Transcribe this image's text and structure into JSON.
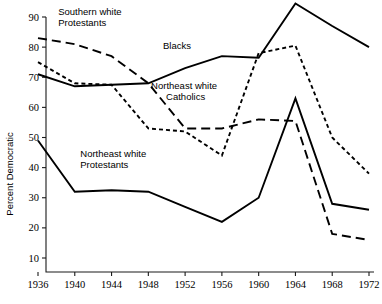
{
  "chart_data": {
    "type": "line",
    "title": "",
    "xlabel": "",
    "ylabel": "Percent Democratic",
    "x": [
      1936,
      1940,
      1944,
      1948,
      1952,
      1956,
      1960,
      1964,
      1968,
      1972
    ],
    "xtick_labels": [
      "1936",
      "1940",
      "1944",
      "1948",
      "1952",
      "1956",
      "1960",
      "1964",
      "1968",
      "1972"
    ],
    "ytick_labels": [
      "10",
      "20",
      "30",
      "40",
      "50",
      "60",
      "70",
      "80",
      "90"
    ],
    "yticks": [
      10,
      20,
      30,
      40,
      50,
      60,
      70,
      80,
      90
    ],
    "xlim": [
      1936,
      1972
    ],
    "ylim": [
      4,
      92
    ],
    "grid": false,
    "legend_position": "inline-annotations",
    "series": [
      {
        "name": "Blacks",
        "style": "solid",
        "label": "Blacks",
        "label_x": 1949.6,
        "label_y": 79.5,
        "values": [
          71,
          67,
          67.5,
          68,
          73,
          77,
          76.5,
          94.5,
          87,
          80
        ]
      },
      {
        "name": "Southern white Protestants",
        "style": "long-dash",
        "label": "Southern white\nProtestants",
        "label_line1": "Southern white",
        "label_line2": "Protestants",
        "label_x": 1938.2,
        "label_y": 90.5,
        "values": [
          83,
          81,
          77,
          68,
          53,
          53,
          56,
          55.5,
          18,
          16
        ]
      },
      {
        "name": "Northeast white Catholics",
        "style": "short-dash",
        "label": "Northeast white\nCatholics",
        "label_line1": "Northeast white",
        "label_line2": "Catholics",
        "label_x": 1948.3,
        "label_y": 66.0,
        "values": [
          75,
          68,
          67.5,
          53,
          52,
          44,
          78,
          80.5,
          50,
          38
        ]
      },
      {
        "name": "Northeast white Protestants",
        "style": "solid",
        "label": "Northeast white\nProtestants",
        "label_line1": "Northeast white",
        "label_line2": "Protestants",
        "label_x": 1940.6,
        "label_y": 43.5,
        "values": [
          49,
          32,
          32.5,
          32,
          27,
          22,
          30,
          63,
          28,
          26
        ]
      }
    ]
  },
  "colors": {
    "line": "#000000",
    "axis": "#1a1a1a",
    "background": "#ffffff"
  }
}
